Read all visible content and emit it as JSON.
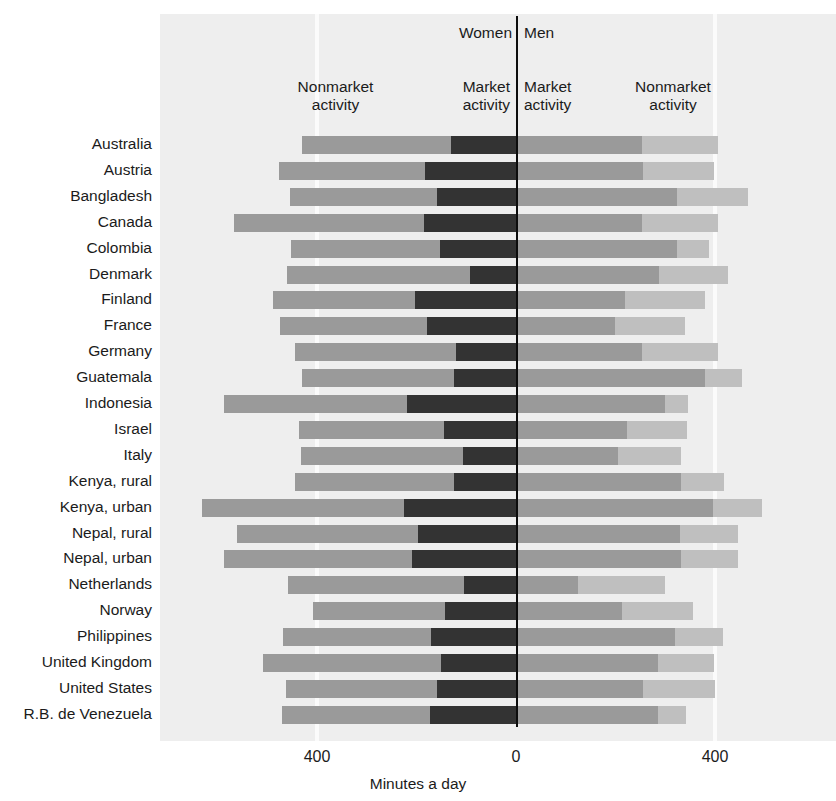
{
  "header": {
    "women_label": "Women",
    "men_label": "Men",
    "women_nonmarket_label": "Nonmarket\nactivity",
    "women_market_label": "Market\nactivity",
    "men_market_label": "Market\nactivity",
    "men_nonmarket_label": "Nonmarket\nactivity"
  },
  "axis": {
    "left_tick": "400",
    "center_tick": "0",
    "right_tick": "400",
    "title": "Minutes a day"
  },
  "colors": {
    "panel": "#eeeeee",
    "gridline": "#fbfbfb",
    "zeroline": "#0d0d0d",
    "nonmarket": "#9a9a9a",
    "market": "#333333",
    "men_market": "#9a9a9a",
    "men_nonmarket": "#bfbfbf"
  },
  "chart_data": {
    "type": "bar",
    "title": "",
    "subtitle": "",
    "xlabel": "Minutes a day",
    "ylabel": "",
    "orientation": "horizontal-diverging",
    "xlim": [
      -560,
      560
    ],
    "xticks": [
      -400,
      0,
      400
    ],
    "xticklabels": [
      "400",
      "0",
      "400"
    ],
    "grid": true,
    "legend_position": "top-inline-labels",
    "stacked": true,
    "units": "minutes per day",
    "note": "Left of zero = Women (nonmarket + market). Right of zero = Men (market + nonmarket).",
    "series": [
      {
        "name": "Women nonmarket activity",
        "side": "left",
        "order": 1,
        "color": "#9a9a9a"
      },
      {
        "name": "Women market activity",
        "side": "left",
        "order": 2,
        "color": "#333333"
      },
      {
        "name": "Men market activity",
        "side": "right",
        "order": 1,
        "color": "#9a9a9a"
      },
      {
        "name": "Men nonmarket activity",
        "side": "right",
        "order": 2,
        "color": "#bfbfbf"
      }
    ],
    "categories": [
      "Australia",
      "Austria",
      "Bangladesh",
      "Canada",
      "Colombia",
      "Denmark",
      "Finland",
      "France",
      "Germany",
      "Guatemala",
      "Indonesia",
      "Israel",
      "Italy",
      "Kenya, rural",
      "Kenya, urban",
      "Nepal, rural",
      "Nepal, urban",
      "Netherlands",
      "Norway",
      "Philippines",
      "United Kingdom",
      "United States",
      "R.B. de Venezuela"
    ],
    "rows": [
      {
        "country": "Australia",
        "women_nonmarket": 300,
        "women_market": 131,
        "men_market": 249,
        "men_nonmarket": 153
      },
      {
        "country": "Austria",
        "women_nonmarket": 295,
        "women_market": 182,
        "men_market": 251,
        "men_nonmarket": 143
      },
      {
        "country": "Bangladesh",
        "women_nonmarket": 297,
        "women_market": 158,
        "men_market": 319,
        "men_nonmarket": 144
      },
      {
        "country": "Canada",
        "women_nonmarket": 381,
        "women_market": 185,
        "men_market": 250,
        "men_nonmarket": 153
      },
      {
        "country": "Colombia",
        "women_nonmarket": 299,
        "women_market": 153,
        "men_market": 319,
        "men_nonmarket": 64
      },
      {
        "country": "Denmark",
        "women_nonmarket": 367,
        "women_market": 93,
        "men_market": 284,
        "men_nonmarket": 139
      },
      {
        "country": "Finland",
        "women_nonmarket": 284,
        "women_market": 204,
        "men_market": 215,
        "men_nonmarket": 160
      },
      {
        "country": "France",
        "women_nonmarket": 296,
        "women_market": 178,
        "men_market": 195,
        "men_nonmarket": 140
      },
      {
        "country": "Germany",
        "women_nonmarket": 323,
        "women_market": 121,
        "men_market": 250,
        "men_nonmarket": 153
      },
      {
        "country": "Guatemala",
        "women_nonmarket": 307,
        "women_market": 124,
        "men_market": 376,
        "men_nonmarket": 74
      },
      {
        "country": "Indonesia",
        "women_nonmarket": 368,
        "women_market": 219,
        "men_market": 296,
        "men_nonmarket": 45
      },
      {
        "country": "Israel",
        "women_nonmarket": 292,
        "women_market": 144,
        "men_market": 220,
        "men_nonmarket": 119
      },
      {
        "country": "Italy",
        "women_nonmarket": 327,
        "women_market": 106,
        "men_market": 201,
        "men_nonmarket": 127
      },
      {
        "country": "Kenya, rural",
        "women_nonmarket": 321,
        "women_market": 124,
        "men_market": 327,
        "men_nonmarket": 88
      },
      {
        "country": "Kenya, urban",
        "women_nonmarket": 406,
        "women_market": 225,
        "men_market": 391,
        "men_nonmarket": 99
      },
      {
        "country": "Nepal, rural",
        "women_nonmarket": 364,
        "women_market": 196,
        "men_market": 325,
        "men_nonmarket": 118
      },
      {
        "country": "Nepal, urban",
        "women_nonmarket": 377,
        "women_market": 210,
        "men_market": 328,
        "men_nonmarket": 114
      },
      {
        "country": "Netherlands",
        "women_nonmarket": 353,
        "women_market": 105,
        "men_market": 120,
        "men_nonmarket": 176
      },
      {
        "country": "Norway",
        "women_nonmarket": 265,
        "women_market": 143,
        "men_market": 210,
        "men_nonmarket": 141
      },
      {
        "country": "Philippines",
        "women_nonmarket": 298,
        "women_market": 170,
        "men_market": 315,
        "men_nonmarket": 98
      },
      {
        "country": "United Kingdom",
        "women_nonmarket": 358,
        "women_market": 150,
        "men_market": 282,
        "men_nonmarket": 111
      },
      {
        "country": "United States",
        "women_nonmarket": 303,
        "women_market": 159,
        "men_market": 251,
        "men_nonmarket": 145
      },
      {
        "country": "R.B. de Venezuela",
        "women_nonmarket": 298,
        "women_market": 172,
        "men_market": 282,
        "men_nonmarket": 56
      }
    ]
  }
}
